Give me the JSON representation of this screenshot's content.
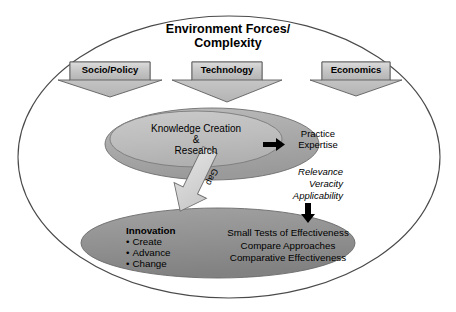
{
  "diagram": {
    "title_line1": "Environment Forces/",
    "title_line2": "Complexity",
    "banners": [
      {
        "label": "Socio/Policy"
      },
      {
        "label": "Technology"
      },
      {
        "label": "Economics"
      }
    ],
    "knowledge_ellipse": {
      "line1": "Knowledge Creation",
      "line2": "&",
      "line3": "Research"
    },
    "practice": {
      "line1": "Practice",
      "line2": "Expertise"
    },
    "criteria": {
      "line1": "Relevance",
      "line2": "Veracity",
      "line3": "Applicability"
    },
    "gap_label": "Gap",
    "innovation": {
      "heading": "Innovation",
      "items": [
        "Create",
        "Advance",
        "Change"
      ]
    },
    "effectiveness": {
      "line1": "Small Tests of Effectiveness",
      "line2": "Compare Approaches",
      "line3": "Comparative Effectiveness"
    },
    "colors": {
      "outer_ellipse_stroke": "#4a4a4a",
      "outer_ellipse_fill": "#ffffff",
      "upper_ellipse_fill": "#a8a8a8",
      "inner_ellipse_fill": "#bdbdbd",
      "lower_ellipse_fill": "#909090",
      "banner_fill": "#c9c9c9",
      "gap_arrow_fill": "#d2d2d2",
      "black_arrow": "#000000"
    }
  }
}
